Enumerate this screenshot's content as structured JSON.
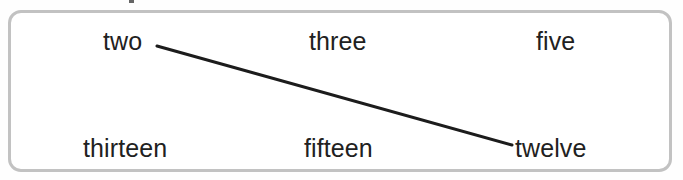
{
  "panel": {
    "border_color": "#c2c2c2",
    "background_color": "#ffffff",
    "corner_radius_px": 13
  },
  "exercise": {
    "type": "word-matching",
    "rows": [
      {
        "row": "top",
        "words": [
          {
            "id": "two",
            "label": "two"
          },
          {
            "id": "three",
            "label": "three"
          },
          {
            "id": "five",
            "label": "five"
          }
        ]
      },
      {
        "row": "bottom",
        "words": [
          {
            "id": "thirteen",
            "label": "thirteen"
          },
          {
            "id": "fifteen",
            "label": "fifteen"
          },
          {
            "id": "twelve",
            "label": "twelve"
          }
        ]
      }
    ],
    "connections": [
      {
        "from": "two",
        "to": "twelve",
        "stroke_color": "#1c1c1c",
        "stroke_width_px": 3,
        "x1": 157,
        "y1": 46,
        "x2": 512,
        "y2": 145
      }
    ]
  }
}
